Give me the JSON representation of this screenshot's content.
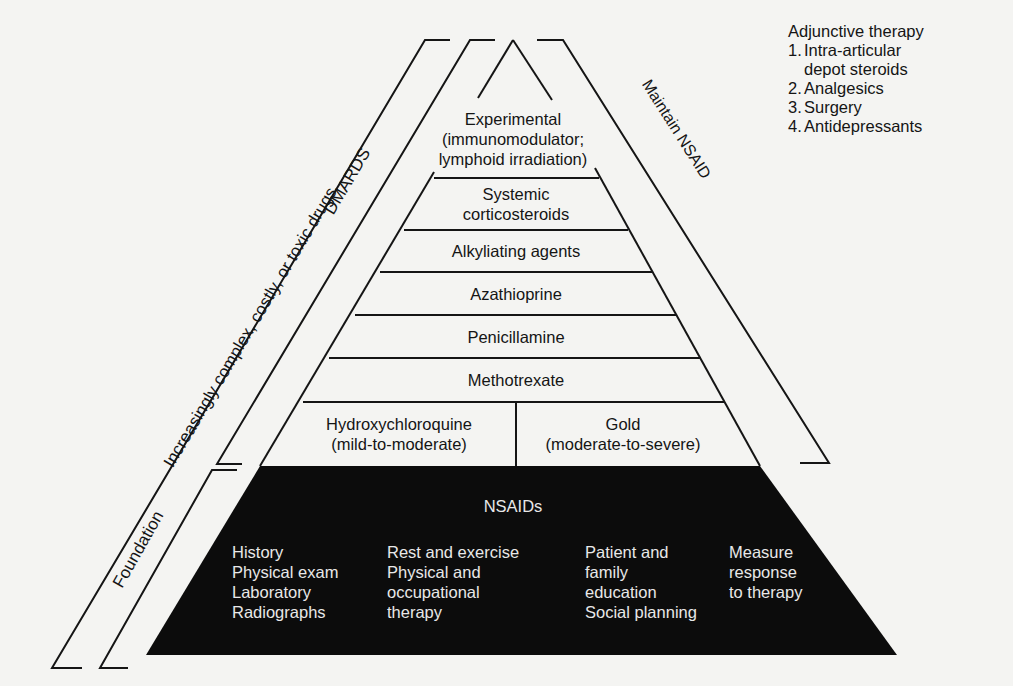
{
  "pyramid": {
    "layers": [
      {
        "id": "experimental",
        "lines": [
          "Experimental",
          "(immunomodulator;",
          "lymphoid irradiation)"
        ]
      },
      {
        "id": "systemic-corticosteroids",
        "lines": [
          "Systemic",
          "corticosteroids"
        ]
      },
      {
        "id": "alkylating-agents",
        "lines": [
          "Alkyliating agents"
        ]
      },
      {
        "id": "azathioprine",
        "lines": [
          "Azathioprine"
        ]
      },
      {
        "id": "penicillamine",
        "lines": [
          "Penicillamine"
        ]
      },
      {
        "id": "methotrexate",
        "lines": [
          "Methotrexate"
        ]
      },
      {
        "id": "hydroxychloroquine",
        "lines": [
          "Hydroxychloroquine",
          "(mild-to-moderate)"
        ]
      },
      {
        "id": "gold",
        "lines": [
          "Gold",
          "(moderate-to-severe)"
        ]
      }
    ],
    "foundation": {
      "title": "NSAIDs",
      "columns": [
        {
          "lines": [
            "History",
            "Physical exam",
            "Laboratory",
            "Radiographs"
          ]
        },
        {
          "lines": [
            "Rest and exercise",
            "Physical and",
            "  occupational",
            "  therapy"
          ]
        },
        {
          "lines": [
            "Patient and",
            "  family",
            "  education",
            "Social planning"
          ]
        },
        {
          "lines": [
            "Measure",
            "  response",
            "  to therapy"
          ]
        }
      ]
    }
  },
  "brackets": {
    "outer_left": "Increasingly complex, costly, or toxic drugs",
    "dmards": "DMARDS",
    "foundation": "Foundation",
    "right": "Maintain NSAID"
  },
  "adjunctive": {
    "title": "Adjunctive therapy",
    "items": [
      {
        "num": "1.",
        "lines": [
          "Intra-articular",
          "depot steroids"
        ]
      },
      {
        "num": "2.",
        "lines": [
          "Analgesics"
        ]
      },
      {
        "num": "3.",
        "lines": [
          "Surgery"
        ]
      },
      {
        "num": "4.",
        "lines": [
          "Antidepressants"
        ]
      }
    ]
  },
  "colors": {
    "ink": "#151515",
    "paper": "#f4f4f2",
    "foundation_fill": "#0c0c0c",
    "foundation_text": "#e8e8e8"
  }
}
